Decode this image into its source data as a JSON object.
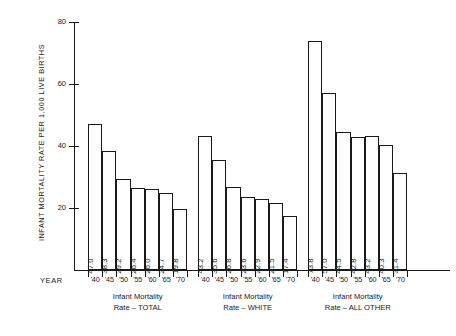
{
  "chart_data": {
    "type": "bar",
    "title": "",
    "subtitle": "",
    "xlabel": "YEAR",
    "ylabel": "INFANT MORTALITY RATE PER 1,000 LIVE BIRTHS",
    "ylim": [
      0,
      80
    ],
    "y_ticks": [
      20,
      40,
      60,
      80
    ],
    "grid": false,
    "legend": "none",
    "categories": [
      "'40",
      "'45",
      "'50",
      "'55",
      "'60",
      "'65",
      "'70"
    ],
    "groups": [
      {
        "caption_line1": "Infant Mortality",
        "caption_line2": "Rate – TOTAL",
        "name": "Infant Mortality Rate – TOTAL",
        "values": [
          47.0,
          38.3,
          29.2,
          26.4,
          26.0,
          24.7,
          19.8
        ],
        "labels": [
          "47.0",
          "38.3",
          "29.2",
          "26.4",
          "26.0",
          "24.7",
          "19.8"
        ]
      },
      {
        "caption_line1": "Infant Mortality",
        "caption_line2": "Rate – WHITE",
        "name": "Infant Mortality Rate – WHITE",
        "values": [
          43.2,
          35.6,
          26.8,
          23.6,
          22.9,
          21.5,
          17.4
        ],
        "labels": [
          "43.2",
          "35.6",
          "26.8",
          "23.6",
          "22.9",
          "21.5",
          "17.4"
        ]
      },
      {
        "caption_line1": "Infant Mortality",
        "caption_line2": "Rate – ALL OTHER",
        "name": "Infant Mortality Rate – ALL OTHER",
        "values": [
          73.8,
          57.0,
          44.5,
          42.8,
          43.2,
          40.3,
          31.4
        ],
        "labels": [
          "73.8",
          "57.0",
          "44.5",
          "42.8",
          "43.2",
          "40.3",
          "31.4"
        ]
      }
    ],
    "colors": {
      "ink": "#1a1a1a",
      "bar_fill": "#ffffff",
      "background": "#ffffff"
    }
  },
  "axis": {
    "year_label": "YEAR",
    "y_title": "INFANT MORTALITY RATE PER 1,000 LIVE BIRTHS",
    "tick_labels": [
      "80",
      "60",
      "40",
      "20"
    ]
  }
}
